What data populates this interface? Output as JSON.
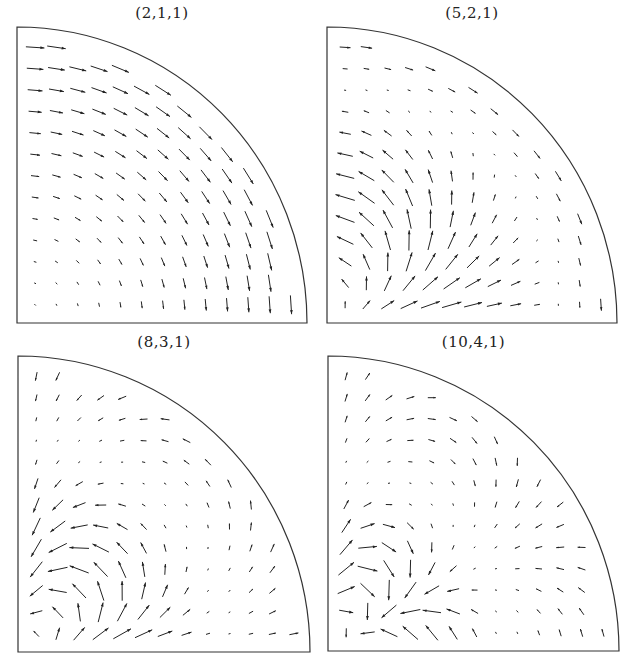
{
  "chart_data": [
    {
      "type": "vector-field",
      "title": "(2,1,1)",
      "domain": "quarter-disc",
      "grid": {
        "rows": 13,
        "cols": 13
      },
      "frame": {
        "left": 17,
        "top": 27,
        "right": 307,
        "bottom": 323
      },
      "description": "Clockwise swirling flow: arrows point right along the top, curving to point down along the right side; magnitude increases toward the arc and decreases toward the bottom-left corner.",
      "field": "swirl"
    },
    {
      "type": "vector-field",
      "title": "(5,2,1)",
      "domain": "quarter-disc",
      "grid": {
        "rows": 13,
        "cols": 13
      },
      "frame": {
        "left": 327,
        "top": 27,
        "right": 617,
        "bottom": 323
      },
      "description": "Two counter-rotating cells: left region rotates counterclockwise (right along bottom, up through middle, left along top); a small clockwise region near the arc with arrows pointing down along the boundary.",
      "field": "mode521"
    },
    {
      "type": "vector-field",
      "title": "(8,3,1)",
      "domain": "quarter-disc",
      "grid": {
        "rows": 13,
        "cols": 13
      },
      "frame": {
        "left": 18,
        "top": 356,
        "right": 310,
        "bottom": 652
      },
      "description": "Three-cell pattern: clockwise cell upper-left (right along top, down through column 3-4, left at middle), counterclockwise cell lower-left, additional weak cells toward the arc.",
      "field": "mode831"
    },
    {
      "type": "vector-field",
      "title": "(10,4,1)",
      "domain": "quarter-disc",
      "grid": {
        "rows": 13,
        "cols": 13
      },
      "frame": {
        "left": 328,
        "top": 356,
        "right": 619,
        "bottom": 651
      },
      "description": "Four-cell pattern: counterclockwise cell upper-left (left along top, up through column 2-3, right at middle), clockwise cell lower-left, further weak alternating cells toward the arc.",
      "field": "mode1041"
    }
  ],
  "panels": [
    {
      "title": "(2,1,1)"
    },
    {
      "title": "(5,2,1)"
    },
    {
      "title": "(8,3,1)"
    },
    {
      "title": "(10,4,1)"
    }
  ]
}
